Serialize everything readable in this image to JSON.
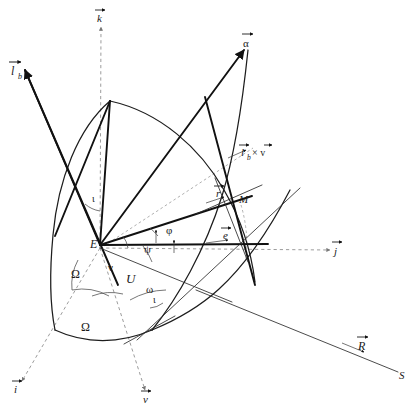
{
  "figure": {
    "type": "vector-geometry-diagram",
    "width": 420,
    "height": 412,
    "background": "#ffffff",
    "line_color": "#111111",
    "dashed_color": "#8a8a8a",
    "text_color": "#1a1a1a"
  },
  "points": [
    {
      "id": "E",
      "label": "E",
      "x": 100,
      "y": 243,
      "role": "origin-earth-center"
    },
    {
      "id": "M",
      "label": "M",
      "x": 238,
      "y": 199,
      "role": "orbiting-body"
    },
    {
      "id": "S",
      "label": "S",
      "x": 401,
      "y": 375,
      "role": "sun-direction-end"
    }
  ],
  "vectors": [
    {
      "id": "k",
      "label": "k",
      "x": 101,
      "y": 17,
      "style": "dashed",
      "arrow": true,
      "role": "z-axis-unit-vector"
    },
    {
      "id": "i",
      "label": "i",
      "x": 17,
      "y": 389,
      "style": "dashed",
      "arrow": true,
      "role": "x-axis-unit-vector"
    },
    {
      "id": "j",
      "label": "j",
      "x": 337,
      "y": 249,
      "style": "dashed",
      "arrow": true,
      "role": "y-axis-unit-vector"
    },
    {
      "id": "nu",
      "label": "v",
      "x": 146,
      "y": 399,
      "style": "dashed",
      "arrow": true,
      "role": "nodal-direction-vector"
    },
    {
      "id": "lb",
      "label": "l",
      "sub": "b",
      "x": 14,
      "y": 70,
      "style": "solid",
      "arrow": true,
      "role": "body-angular-momentum-vector"
    },
    {
      "id": "alpha",
      "label": "α",
      "x": 247,
      "y": 42,
      "style": "solid",
      "arrow": true,
      "role": "alpha-vector"
    },
    {
      "id": "lbxv",
      "label": "l",
      "sub": "b",
      "suffix": "× v",
      "x": 243,
      "y": 150,
      "style": "solid",
      "arrow": true,
      "role": "cross-product-vector"
    },
    {
      "id": "r",
      "label": "r",
      "x": 219,
      "y": 192,
      "style": "solid",
      "arrow": true,
      "role": "position-vector"
    },
    {
      "id": "e",
      "label": "e",
      "x": 226,
      "y": 234,
      "style": "solid",
      "arrow": true,
      "role": "eccentricity-vector"
    },
    {
      "id": "R",
      "label": "R",
      "x": 361,
      "y": 345,
      "style": "solid",
      "arrow": true,
      "role": "sun-position-vector"
    }
  ],
  "angles": [
    {
      "id": "iota-top",
      "label": "ι",
      "x": 95,
      "y": 198,
      "role": "inclination-at-apex"
    },
    {
      "id": "iota-node",
      "label": "ι",
      "x": 156,
      "y": 299,
      "role": "inclination-at-node"
    },
    {
      "id": "Omega-1",
      "label": "Ω",
      "x": 77,
      "y": 273,
      "role": "right-ascension-ascending-node-inner"
    },
    {
      "id": "Omega-2",
      "label": "Ω",
      "x": 87,
      "y": 326,
      "role": "right-ascension-ascending-node-arc"
    },
    {
      "id": "nu-angle",
      "label": "ν",
      "x": 112,
      "y": 266,
      "role": "true-anomaly"
    },
    {
      "id": "U",
      "label": "U",
      "x": 131,
      "y": 277,
      "role": "argument-of-latitude"
    },
    {
      "id": "psi",
      "label": "ψ",
      "x": 148,
      "y": 248,
      "role": "psi-angle"
    },
    {
      "id": "omega",
      "label": "ω",
      "x": 150,
      "y": 288,
      "role": "argument-of-perigee"
    },
    {
      "id": "phi",
      "label": "φ",
      "x": 170,
      "y": 229,
      "role": "phi-angle"
    }
  ],
  "curves": [
    {
      "id": "orbit-arc",
      "role": "orbital-great-circle"
    },
    {
      "id": "equator-arc",
      "role": "equatorial-great-circle"
    },
    {
      "id": "node-arc",
      "role": "nodal-arc-Omega"
    }
  ]
}
